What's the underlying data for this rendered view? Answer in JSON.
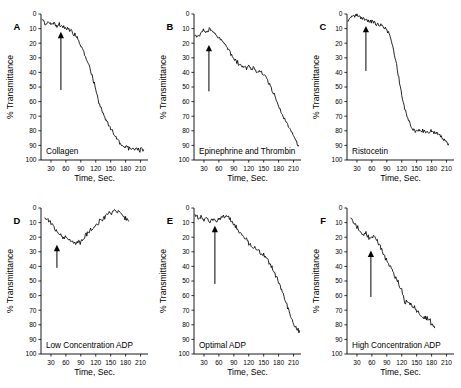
{
  "figure": {
    "title": "",
    "background": "#ffffff",
    "trace_color": "#000000",
    "rows": 2,
    "cols": 3
  },
  "axes_common": {
    "xlabel": "Time, Sec.",
    "ylabel": "% Transmittance",
    "xticks": [
      30,
      60,
      90,
      120,
      150,
      180,
      210
    ],
    "xtick_labels": [
      "30",
      "60",
      "90",
      "120",
      "150",
      "180",
      "210"
    ],
    "yticks": [
      0,
      10,
      20,
      30,
      40,
      50,
      60,
      70,
      80,
      90,
      100
    ],
    "ytick_labels": [
      "0",
      "10",
      "20",
      "30",
      "40",
      "50",
      "60",
      "70",
      "80",
      "90",
      "100"
    ],
    "xlim": [
      10,
      225
    ],
    "ylim": [
      0,
      100
    ],
    "y_inverted": true,
    "grid": false
  },
  "chart_data": {
    "type": "line",
    "xlabel": "Time, Sec.",
    "ylabel": "% Transmittance",
    "xlim": [
      10,
      225
    ],
    "ylim": [
      0,
      100
    ],
    "y_inverted": true,
    "grid": false,
    "legend": "none",
    "xticks": [
      30,
      60,
      90,
      120,
      150,
      180,
      210
    ],
    "yticks": [
      0,
      10,
      20,
      30,
      40,
      50,
      60,
      70,
      80,
      90,
      100
    ],
    "panels": [
      {
        "letter": "A",
        "label": "Collagen",
        "agonist_arrow_time": 50,
        "arrow_from_y": 52,
        "arrow_to_y": 13,
        "x": [
          12,
          18,
          24,
          30,
          36,
          42,
          48,
          54,
          60,
          66,
          72,
          78,
          84,
          90,
          96,
          102,
          108,
          114,
          120,
          126,
          132,
          138,
          144,
          150,
          156,
          162,
          168,
          174,
          180,
          186,
          192,
          198,
          204,
          210,
          216
        ],
        "y": [
          3,
          6,
          5,
          7,
          6,
          8,
          7,
          9,
          9,
          10,
          12,
          14,
          17,
          21,
          26,
          31,
          36,
          44,
          52,
          60,
          66,
          71,
          75,
          79,
          82,
          85,
          88,
          90,
          91,
          92,
          93,
          93,
          93,
          93,
          93
        ]
      },
      {
        "letter": "B",
        "label": "Epinephrine and Thrombin",
        "agonist_arrow_time": 40,
        "arrow_from_y": 53,
        "arrow_to_y": 22,
        "x": [
          12,
          18,
          24,
          30,
          36,
          42,
          48,
          54,
          60,
          66,
          72,
          78,
          84,
          90,
          96,
          102,
          108,
          114,
          120,
          126,
          132,
          138,
          144,
          150,
          156,
          162,
          168,
          174,
          180,
          186,
          192,
          198,
          204,
          210,
          216,
          220
        ],
        "y": [
          16,
          15,
          13,
          11,
          12,
          10,
          13,
          15,
          17,
          18,
          21,
          24,
          27,
          30,
          33,
          35,
          36,
          37,
          36,
          37,
          38,
          39,
          40,
          41,
          44,
          48,
          53,
          58,
          63,
          68,
          72,
          76,
          80,
          83,
          87,
          90
        ]
      },
      {
        "letter": "C",
        "label": "Ristocetin",
        "agonist_arrow_time": 48,
        "arrow_from_y": 39,
        "arrow_to_y": 9,
        "x": [
          12,
          18,
          24,
          30,
          36,
          42,
          48,
          54,
          60,
          66,
          72,
          78,
          84,
          90,
          96,
          102,
          108,
          114,
          120,
          126,
          132,
          138,
          144,
          150,
          156,
          162,
          168,
          174,
          180,
          186,
          192,
          198,
          204,
          210,
          214
        ],
        "y": [
          5,
          2,
          1,
          0,
          2,
          3,
          4,
          5,
          5,
          6,
          7,
          8,
          9,
          11,
          15,
          22,
          32,
          44,
          56,
          65,
          71,
          76,
          79,
          80,
          80,
          80,
          81,
          81,
          80,
          81,
          82,
          84,
          86,
          88,
          89
        ]
      },
      {
        "letter": "D",
        "label": "Low Concentration ADP",
        "agonist_arrow_time": 42,
        "arrow_from_y": 41,
        "arrow_to_y": 26,
        "x": [
          18,
          24,
          30,
          36,
          42,
          48,
          54,
          60,
          66,
          72,
          78,
          84,
          90,
          96,
          102,
          108,
          114,
          120,
          126,
          132,
          138,
          144,
          150,
          156,
          162,
          168,
          174,
          180,
          186
        ],
        "y": [
          6,
          8,
          10,
          13,
          16,
          18,
          20,
          21,
          22,
          23,
          24,
          24,
          23,
          21,
          18,
          16,
          14,
          12,
          10,
          8,
          6,
          4,
          3,
          2,
          3,
          3,
          5,
          7,
          9
        ]
      },
      {
        "letter": "E",
        "label": "Optimal ADP",
        "agonist_arrow_time": 52,
        "arrow_from_y": 52,
        "arrow_to_y": 13,
        "x": [
          12,
          18,
          24,
          30,
          36,
          42,
          48,
          54,
          60,
          66,
          72,
          78,
          84,
          90,
          96,
          102,
          108,
          114,
          120,
          126,
          132,
          138,
          144,
          150,
          156,
          162,
          168,
          174,
          180,
          186,
          192,
          198,
          204,
          210,
          216,
          222
        ],
        "y": [
          4,
          7,
          6,
          9,
          7,
          9,
          8,
          9,
          8,
          7,
          6,
          6,
          8,
          11,
          14,
          17,
          19,
          21,
          24,
          26,
          28,
          29,
          31,
          32,
          35,
          38,
          42,
          46,
          51,
          56,
          62,
          68,
          74,
          79,
          83,
          84
        ]
      },
      {
        "letter": "F",
        "label": "High Concentration ADP",
        "agonist_arrow_time": 58,
        "arrow_from_y": 61,
        "arrow_to_y": 30,
        "x": [
          18,
          24,
          30,
          36,
          42,
          48,
          54,
          60,
          66,
          72,
          78,
          84,
          90,
          96,
          102,
          108,
          114,
          120,
          126,
          132,
          138,
          144,
          150,
          156,
          162,
          168,
          174,
          180,
          186
        ],
        "y": [
          6,
          10,
          13,
          16,
          19,
          17,
          21,
          20,
          19,
          23,
          28,
          32,
          36,
          40,
          44,
          48,
          52,
          56,
          64,
          64,
          66,
          68,
          70,
          73,
          75,
          75,
          76,
          79,
          82
        ]
      }
    ]
  }
}
